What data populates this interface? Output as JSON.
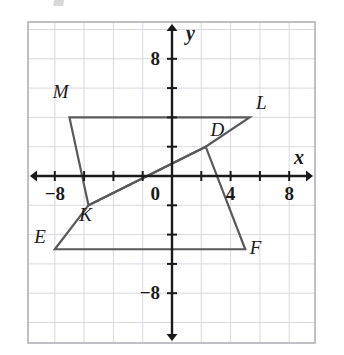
{
  "figure": {
    "kind": "coordinate-plane-geometry",
    "axis_label_x": "x",
    "axis_label_y": "y",
    "origin_label": "0"
  },
  "colors": {
    "background": "#ffffff",
    "grid_minor": "#d8d8e2",
    "plot_border": "#b0b0b8",
    "axis": "#1a1a1a",
    "shape_stroke": "#595959",
    "label_text": "#1a1a1a"
  },
  "chart_data": {
    "type": "scatter",
    "title": "",
    "xlabel": "x",
    "ylabel": "y",
    "xlim": [
      -10,
      10
    ],
    "ylim": [
      -10,
      10
    ],
    "grid": true,
    "grid_step": 2,
    "legend": "none",
    "x_tick_labels": [
      {
        "value": -8,
        "text": "−8"
      },
      {
        "value": 0,
        "text": "0"
      },
      {
        "value": 4,
        "text": "4"
      },
      {
        "value": 8,
        "text": "8"
      }
    ],
    "y_tick_labels": [
      {
        "value": 8,
        "text": "8"
      },
      {
        "value": -8,
        "text": "−8"
      }
    ],
    "x_ticks": [
      -8,
      -6,
      -4,
      -2,
      2,
      4,
      6,
      8
    ],
    "y_ticks": [
      8,
      6,
      4,
      2,
      -2,
      -4,
      -6,
      -8
    ],
    "shapes": [
      {
        "name": "quadrilateral-KLMD",
        "closed": true,
        "vertices": [
          {
            "label": "M",
            "x": -7.0,
            "y": 4.0
          },
          {
            "label": "L",
            "x": 5.3,
            "y": 4.0
          },
          {
            "label": "D",
            "x": 2.3,
            "y": 2.0
          },
          {
            "label": "K",
            "x": -5.7,
            "y": -2.0
          }
        ]
      },
      {
        "name": "quadrilateral-EFDK",
        "closed": true,
        "vertices": [
          {
            "label": "E",
            "x": -8.0,
            "y": -5.0
          },
          {
            "label": "F",
            "x": 5.0,
            "y": -5.0
          },
          {
            "label": "D",
            "x": 2.3,
            "y": 2.0
          },
          {
            "label": "K",
            "x": -5.7,
            "y": -2.0
          }
        ]
      }
    ],
    "vertex_labels": [
      {
        "text": "M",
        "x": -7.6,
        "y": 5.3
      },
      {
        "text": "L",
        "x": 6.1,
        "y": 4.6
      },
      {
        "text": "D",
        "x": 3.1,
        "y": 2.7
      },
      {
        "text": "K",
        "x": -5.9,
        "y": -3.1
      },
      {
        "text": "E",
        "x": -9.0,
        "y": -4.6
      },
      {
        "text": "F",
        "x": 5.7,
        "y": -5.3
      }
    ]
  }
}
